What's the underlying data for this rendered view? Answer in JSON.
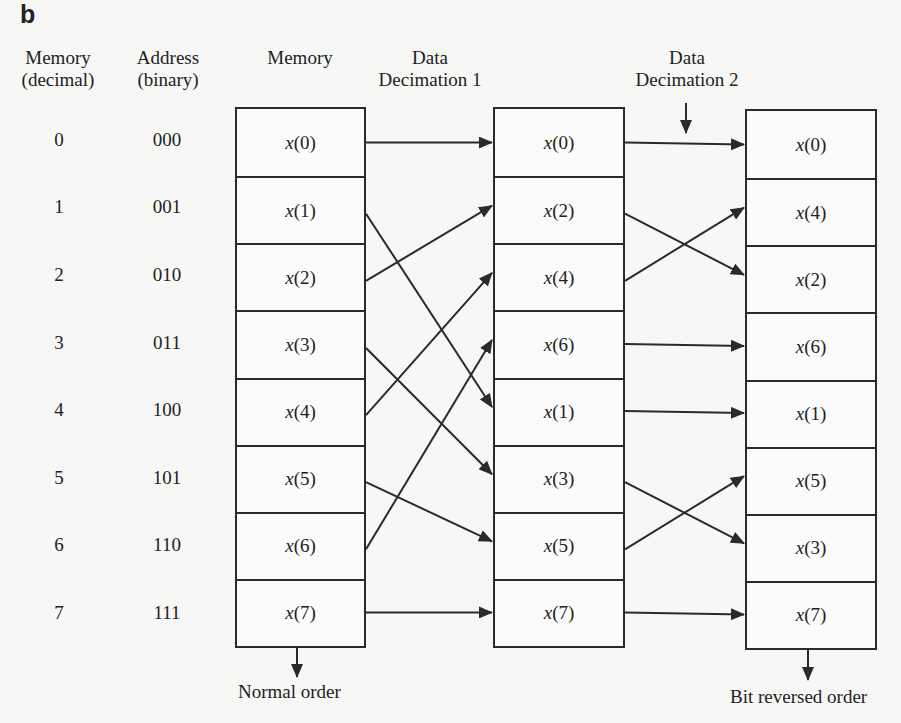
{
  "panel_label": "b",
  "headers": {
    "memory_decimal": [
      "Memory",
      "(decimal)"
    ],
    "address_binary": [
      "Address",
      "(binary)"
    ],
    "memory": "Memory",
    "decimation1": [
      "Data",
      "Decimation 1"
    ],
    "decimation2": [
      "Data",
      "Decimation 2"
    ]
  },
  "rows": [
    {
      "decimal": "0",
      "binary": "000"
    },
    {
      "decimal": "1",
      "binary": "001"
    },
    {
      "decimal": "2",
      "binary": "010"
    },
    {
      "decimal": "3",
      "binary": "011"
    },
    {
      "decimal": "4",
      "binary": "100"
    },
    {
      "decimal": "5",
      "binary": "101"
    },
    {
      "decimal": "6",
      "binary": "110"
    },
    {
      "decimal": "7",
      "binary": "111"
    }
  ],
  "blocks": {
    "memory": [
      "0",
      "1",
      "2",
      "3",
      "4",
      "5",
      "6",
      "7"
    ],
    "decimation1": [
      "0",
      "2",
      "4",
      "6",
      "1",
      "3",
      "5",
      "7"
    ],
    "decimation2": [
      "0",
      "4",
      "2",
      "6",
      "1",
      "5",
      "3",
      "7"
    ]
  },
  "stage1_map": [
    0,
    4,
    1,
    5,
    2,
    6,
    3,
    7
  ],
  "stage2_map": [
    0,
    2,
    1,
    3,
    4,
    6,
    5,
    7
  ],
  "footer": {
    "normal_order": "Normal order",
    "bit_reversed_order": "Bit reversed order"
  },
  "colors": {
    "line": "#2a2a2a",
    "background": "#f7f7f6"
  }
}
